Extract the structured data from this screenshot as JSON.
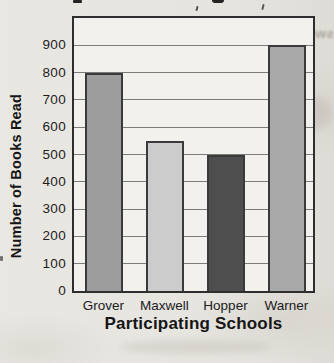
{
  "page": {
    "background": "#e6e4df",
    "ghost_text": "swer each question"
  },
  "chart_data": {
    "type": "bar",
    "categories": [
      "Grover",
      "Maxwell",
      "Hopper",
      "Warner"
    ],
    "values": [
      800,
      550,
      500,
      900
    ],
    "title": "",
    "xlabel": "Participating Schools",
    "ylabel": "Number of Books Read",
    "ylim": [
      0,
      1000
    ],
    "ytick_step": 100,
    "ytick_labels": [
      "900",
      "800",
      "700",
      "600",
      "500",
      "400",
      "300",
      "200",
      "100",
      "0"
    ],
    "grid": true,
    "legend_position": "none",
    "bar_colors": [
      "#9d9d9d",
      "#cccccc",
      "#4e4e4e",
      "#a8a8a8"
    ],
    "bar_outline": "#3a3a3a",
    "frame_color": "#2e2e2f",
    "grid_color": "#7b7b79",
    "plot_bg": "#f2f1ed"
  }
}
